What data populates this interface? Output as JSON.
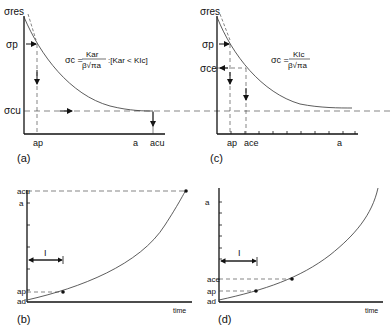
{
  "panels": {
    "a": {
      "label": "(a)",
      "y_axis_label": "σres",
      "y_ticks": [
        "σp",
        "σcu"
      ],
      "x_ticks": [
        "ap",
        "a",
        "acu"
      ],
      "equation": {
        "lhs": "σc =",
        "numerator": "Kar",
        "denominator": "β√πa",
        "condition": ":[Kar < KIc]"
      }
    },
    "b": {
      "label": "(b)",
      "y_axis_label": "a",
      "y_ticks": [
        "acu",
        "ap",
        "ad"
      ],
      "x_axis_label": "time",
      "interval_label": "I"
    },
    "c": {
      "label": "(c)",
      "y_axis_label": "σres",
      "y_ticks": [
        "σp",
        "σce"
      ],
      "x_ticks": [
        "ap",
        "ace",
        "a"
      ],
      "equation": {
        "lhs": "σc =",
        "numerator": "KIc",
        "denominator": "β√πa"
      }
    },
    "d": {
      "label": "(d)",
      "y_axis_label": "a",
      "y_ticks": [
        "ace",
        "ap",
        "ad"
      ],
      "x_axis_label": "time",
      "interval_label": "I"
    }
  }
}
